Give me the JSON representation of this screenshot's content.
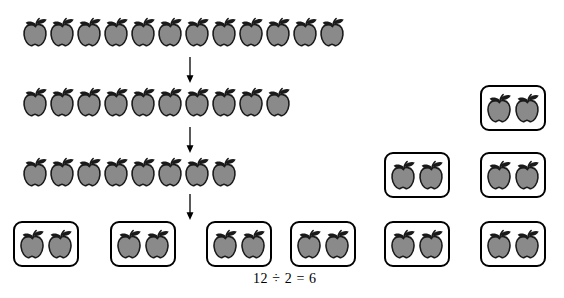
{
  "figure": {
    "title_text": "",
    "equation": "12 ÷ 2 = 6",
    "icon_name": "apple-icon",
    "arrow_icon_name": "down-arrow-icon",
    "colors": {
      "apple_body": "#8a8a8a",
      "apple_outline": "#1a1a1a",
      "leaf": "#1a1a1a",
      "stem": "#1a1a1a",
      "box_border": "#000000",
      "background": "#ffffff",
      "text": "#000000"
    }
  },
  "rows": [
    {
      "name": "row-1-twelve-apples",
      "count": 12,
      "label": "12"
    },
    {
      "name": "row-2-ten-apples",
      "count": 10,
      "label": "10"
    },
    {
      "name": "row-3-eight-apples",
      "count": 8,
      "label": "8"
    }
  ],
  "arrows": [
    {
      "name": "arrow-1",
      "label": "down-arrow"
    },
    {
      "name": "arrow-2",
      "label": "down-arrow"
    },
    {
      "name": "arrow-3",
      "label": "down-arrow"
    }
  ],
  "groups": [
    {
      "name": "group-box-1",
      "apples": 2
    },
    {
      "name": "group-box-2",
      "apples": 2
    },
    {
      "name": "group-box-3",
      "apples": 2
    },
    {
      "name": "group-box-4",
      "apples": 2
    },
    {
      "name": "group-box-5",
      "apples": 2
    },
    {
      "name": "group-box-6",
      "apples": 2
    },
    {
      "name": "group-box-7",
      "apples": 2
    },
    {
      "name": "group-box-8",
      "apples": 2
    },
    {
      "name": "group-box-9",
      "apples": 2
    }
  ],
  "totals": {
    "dividend": "12",
    "divisor": "2",
    "quotient": "6"
  }
}
